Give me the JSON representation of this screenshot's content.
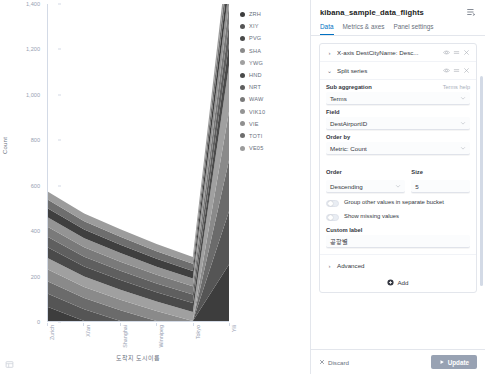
{
  "chart_data": {
    "type": "area",
    "title": "",
    "xlabel": "도착지 도시이름",
    "ylabel": "Count",
    "ylim": [
      0,
      1400
    ],
    "yticks": [
      0,
      200,
      400,
      600,
      800,
      1000,
      1200,
      1400
    ],
    "ytick_labels": [
      "0",
      "200",
      "400",
      "600",
      "800",
      "1,000",
      "1,200",
      "1,400"
    ],
    "grid": false,
    "stacked": true,
    "legend_position": "right",
    "categories": [
      "Zurich",
      "Xi'an",
      "Shanghai",
      "Winnipeg",
      "Tokyo",
      "Yili"
    ],
    "series": [
      {
        "name": "ZRH",
        "color": "#3d3d3d",
        "values": [
          62,
          0,
          0,
          0,
          0,
          250
        ]
      },
      {
        "name": "XIY",
        "color": "#555555",
        "values": [
          58,
          52,
          0,
          0,
          0,
          235
        ]
      },
      {
        "name": "PVG",
        "color": "#6b6b6b",
        "values": [
          55,
          50,
          48,
          0,
          0,
          225
        ]
      },
      {
        "name": "SHA",
        "color": "#8a8a8a",
        "values": [
          52,
          48,
          46,
          44,
          0,
          215
        ]
      },
      {
        "name": "YWG",
        "color": "#a0a0a0",
        "values": [
          50,
          46,
          44,
          42,
          40,
          205
        ]
      },
      {
        "name": "HND",
        "color": "#4a4a4a",
        "values": [
          48,
          45,
          43,
          41,
          39,
          95
        ]
      },
      {
        "name": "NRT",
        "color": "#5f5f5f",
        "values": [
          46,
          43,
          41,
          39,
          38,
          88
        ]
      },
      {
        "name": "WAW",
        "color": "#7a7a7a",
        "values": [
          44,
          42,
          40,
          38,
          36,
          82
        ]
      },
      {
        "name": "VIE",
        "color": "#949494",
        "values": [
          42,
          40,
          38,
          36,
          35,
          76
        ]
      },
      {
        "name": "VIE2",
        "color": "#3f3f3f",
        "values": [
          40,
          38,
          37,
          35,
          33,
          70
        ]
      },
      {
        "name": "TOTI",
        "color": "#6e6e6e",
        "values": [
          38,
          36,
          35,
          33,
          32,
          64
        ]
      },
      {
        "name": "VE05",
        "color": "#9c9c9c",
        "values": [
          36,
          35,
          33,
          32,
          30,
          58
        ]
      }
    ],
    "legend": [
      {
        "label": "ZRH",
        "color": "#3d3d3d"
      },
      {
        "label": "XIY",
        "color": "#555555"
      },
      {
        "label": "PVG",
        "color": "#4a4a4a"
      },
      {
        "label": "SHA",
        "color": "#8a8a8a"
      },
      {
        "label": "YWG",
        "color": "#a0a0a0"
      },
      {
        "label": "HND",
        "color": "#4a4a4a"
      },
      {
        "label": "NRT",
        "color": "#5f5f5f"
      },
      {
        "label": "WAW",
        "color": "#7a7a7a"
      },
      {
        "label": "VIK10",
        "color": "#949494"
      },
      {
        "label": "VIE",
        "color": "#8f8f8f"
      },
      {
        "label": "TOTI",
        "color": "#6e6e6e"
      },
      {
        "label": "VE05",
        "color": "#9c9c9c"
      }
    ]
  },
  "panel": {
    "title": "kibana_sample_data_flights",
    "menu_icon": "panel-menu-icon",
    "tabs": [
      {
        "label": "Data",
        "active": true
      },
      {
        "label": "Metrics & axes",
        "active": false
      },
      {
        "label": "Panel settings",
        "active": false
      }
    ],
    "aggregations": [
      {
        "caret": "›",
        "label": "X-axis DestCityName: Desc..."
      },
      {
        "caret": "⌄",
        "label": "Split series"
      }
    ],
    "sub_aggregation": {
      "label": "Sub aggregation",
      "help": "Terms help",
      "value": "Terms"
    },
    "field": {
      "label": "Field",
      "value": "DestAirportID"
    },
    "order_by": {
      "label": "Order by",
      "value": "Metric: Count"
    },
    "order": {
      "label": "Order",
      "value": "Descending"
    },
    "size": {
      "label": "Size",
      "value": "5"
    },
    "toggles": [
      {
        "label": "Group other values in separate bucket",
        "on": false
      },
      {
        "label": "Show missing values",
        "on": false
      }
    ],
    "custom_label": {
      "label": "Custom label",
      "value": "공항별"
    },
    "advanced": {
      "caret": "›",
      "label": "Advanced"
    },
    "add": {
      "label": "Add"
    },
    "footer": {
      "discard": "Discard",
      "update": "Update"
    }
  }
}
